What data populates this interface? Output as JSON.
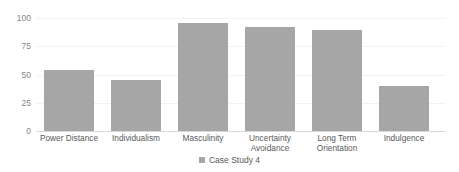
{
  "chart_data": {
    "type": "bar",
    "title": "",
    "subtitle": "",
    "xlabel": "",
    "ylabel": "",
    "ylim": [
      0,
      100
    ],
    "yticks": [
      "0",
      "25",
      "50",
      "75",
      "100"
    ],
    "ytick_values": [
      0,
      25,
      50,
      75,
      100
    ],
    "grid": true,
    "legend_position": "bottom-center",
    "categories": [
      "Power Distance",
      "Individualism",
      "Masculinity",
      "Uncertainty\nAvoidance",
      "Long Term\nOrientation",
      "Indulgence"
    ],
    "series": [
      {
        "name": "Case Study 4",
        "color": "#a6a6a6",
        "values": [
          54,
          45,
          96,
          92,
          89,
          40
        ]
      }
    ]
  },
  "legend": {
    "items": [
      {
        "label": "Case Study 4",
        "swatch": "legend-swatch-icon",
        "color": "#a6a6a6"
      }
    ]
  },
  "colors": {
    "bar": "#a6a6a6",
    "grid": "#f2f2f2",
    "axis": "#d9d9d9",
    "tick_text": "#888888",
    "label_text": "#595959",
    "background": "#ffffff"
  }
}
